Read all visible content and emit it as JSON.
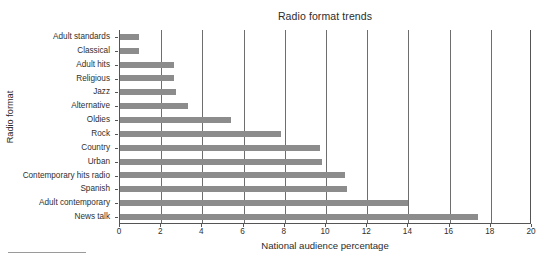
{
  "chart_data": {
    "type": "bar",
    "orientation": "horizontal",
    "title": "Radio format trends",
    "xlabel": "National audience percentage",
    "ylabel": "Radio format",
    "xlim": [
      0,
      20
    ],
    "xticks": [
      0,
      2,
      4,
      6,
      8,
      10,
      12,
      14,
      16,
      18,
      20
    ],
    "xtick_labels": [
      "0",
      "2",
      "4",
      "6",
      "8",
      "10",
      "12",
      "14",
      "16",
      "18",
      "20"
    ],
    "grid": "vertical",
    "legend": null,
    "bar_color": "#8c8c8c",
    "axis_color": "#555555",
    "gridline_color": "#6e6e6e",
    "categories": [
      "Adult standards",
      "Classical",
      "Adult hits",
      "Religious",
      "Jazz",
      "Alternative",
      "Oldies",
      "Rock",
      "Country",
      "Urban",
      "Contemporary hits radio",
      "Spanish",
      "Adult contemporary",
      "News talk"
    ],
    "values": [
      0.9,
      0.9,
      2.6,
      2.6,
      2.7,
      3.3,
      5.4,
      7.8,
      9.7,
      9.8,
      10.9,
      11.0,
      14.0,
      17.4
    ]
  }
}
